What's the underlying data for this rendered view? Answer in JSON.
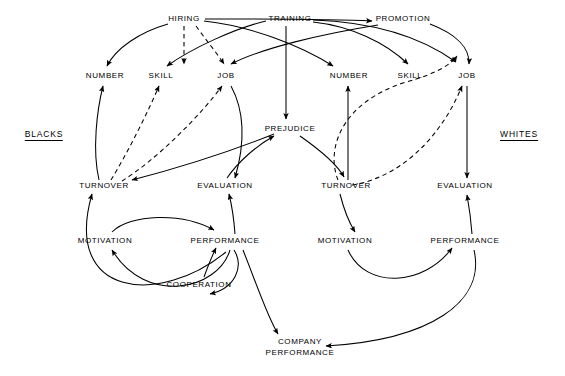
{
  "figure": {
    "type": "causal-loop-diagram",
    "title_visible": false,
    "background_color": "#ffffff",
    "line_color": "#000000",
    "solid_line_meaning": "direct causal influence",
    "dashed_line_meaning": "indirect or attenuated causal influence"
  },
  "groups": {
    "left": {
      "label": "BLACKS",
      "x": 44,
      "y": 135
    },
    "right": {
      "label": "WHITES",
      "x": 519,
      "y": 135
    }
  },
  "inputs": [
    {
      "id": "hiring",
      "label": "HIRING",
      "x": 184,
      "y": 19
    },
    {
      "id": "training",
      "label": "TRAINING",
      "x": 290,
      "y": 19
    },
    {
      "id": "promotion",
      "label": "PROMOTION",
      "x": 403,
      "y": 19
    }
  ],
  "nodes_left": [
    {
      "id": "number_b",
      "label": "NUMBER",
      "x": 105,
      "y": 76
    },
    {
      "id": "skill_b",
      "label": "SKILL",
      "x": 161,
      "y": 76
    },
    {
      "id": "job_b",
      "label": "JOB",
      "x": 226,
      "y": 76
    },
    {
      "id": "turnover_b",
      "label": "TURNOVER",
      "x": 104,
      "y": 186
    },
    {
      "id": "evaluation_b",
      "label": "EVALUATION",
      "x": 225,
      "y": 186
    },
    {
      "id": "motivation_b",
      "label": "MOTIVATION",
      "x": 105,
      "y": 241
    },
    {
      "id": "performance_b",
      "label": "PERFORMANCE",
      "x": 225,
      "y": 241
    },
    {
      "id": "cooperation_b",
      "label": "COOPERATION",
      "x": 199,
      "y": 285
    }
  ],
  "nodes_right": [
    {
      "id": "number_w",
      "label": "NUMBER",
      "x": 349,
      "y": 76
    },
    {
      "id": "skill_w",
      "label": "SKILL",
      "x": 410,
      "y": 76
    },
    {
      "id": "job_w",
      "label": "JOB",
      "x": 467,
      "y": 76
    },
    {
      "id": "turnover_w",
      "label": "TURNOVER",
      "x": 346,
      "y": 186
    },
    {
      "id": "evaluation_w",
      "label": "EVALUATION",
      "x": 465,
      "y": 186
    },
    {
      "id": "motivation_w",
      "label": "MOTIVATION",
      "x": 345,
      "y": 241
    },
    {
      "id": "performance_w",
      "label": "PERFORMANCE",
      "x": 465,
      "y": 241
    }
  ],
  "nodes_shared": [
    {
      "id": "prejudice",
      "label": "PREJUDICE",
      "x": 290,
      "y": 129
    },
    {
      "id": "company_performance",
      "label_line1": "COMPANY",
      "label_line2": "PERFORMANCE",
      "x": 300,
      "y": 347
    }
  ],
  "edges": [
    {
      "from": "hiring",
      "to": "number_b",
      "style": "solid"
    },
    {
      "from": "hiring",
      "to": "skill_b",
      "style": "dashed"
    },
    {
      "from": "hiring",
      "to": "job_b",
      "style": "dashed"
    },
    {
      "from": "hiring",
      "to": "number_w",
      "style": "solid"
    },
    {
      "from": "hiring",
      "to": "promotion",
      "style": "solid"
    },
    {
      "from": "training",
      "to": "skill_b",
      "style": "solid"
    },
    {
      "from": "training",
      "to": "prejudice",
      "style": "solid"
    },
    {
      "from": "training",
      "to": "skill_w",
      "style": "solid"
    },
    {
      "from": "training",
      "to": "job_w",
      "style": "solid"
    },
    {
      "from": "promotion",
      "to": "job_b",
      "style": "solid"
    },
    {
      "from": "promotion",
      "to": "job_w",
      "style": "solid"
    },
    {
      "from": "turnover_b",
      "to": "number_b",
      "style": "solid"
    },
    {
      "from": "turnover_b",
      "to": "skill_b",
      "style": "dashed"
    },
    {
      "from": "turnover_b",
      "to": "job_b",
      "style": "dashed"
    },
    {
      "from": "turnover_w",
      "to": "number_w",
      "style": "solid"
    },
    {
      "from": "turnover_w",
      "to": "skill_w",
      "style": "dashed"
    },
    {
      "from": "turnover_w",
      "to": "job_w",
      "style": "dashed"
    },
    {
      "from": "prejudice",
      "to": "turnover_w",
      "style": "solid"
    },
    {
      "from": "prejudice",
      "to": "turnover_b",
      "style": "solid"
    },
    {
      "from": "evaluation_b",
      "to": "prejudice",
      "style": "solid"
    },
    {
      "from": "job_b",
      "to": "evaluation_b",
      "style": "solid"
    },
    {
      "from": "job_w",
      "to": "evaluation_w",
      "style": "solid"
    },
    {
      "from": "performance_b",
      "to": "evaluation_b",
      "style": "solid"
    },
    {
      "from": "performance_w",
      "to": "evaluation_w",
      "style": "solid"
    },
    {
      "from": "motivation_b",
      "to": "performance_b",
      "style": "solid"
    },
    {
      "from": "motivation_w",
      "to": "performance_w",
      "style": "solid"
    },
    {
      "from": "cooperation_b",
      "to": "performance_b",
      "style": "solid"
    },
    {
      "from": "performance_b",
      "to": "cooperation_b",
      "style": "solid"
    },
    {
      "from": "performance_b",
      "to": "motivation_b",
      "style": "solid"
    },
    {
      "from": "performance_b",
      "to": "turnover_b",
      "style": "solid"
    },
    {
      "from": "performance_b",
      "to": "company_performance",
      "style": "solid"
    },
    {
      "from": "performance_w",
      "to": "company_performance",
      "style": "solid"
    },
    {
      "from": "turnover_w",
      "to": "motivation_w",
      "style": "solid"
    },
    {
      "from": "turnover_b",
      "to": "motivation_b",
      "style": "solid"
    }
  ]
}
